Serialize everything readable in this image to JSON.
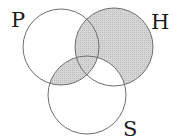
{
  "diagram": {
    "type": "venn",
    "sets": [
      {
        "id": "P",
        "label": "P",
        "cx": 61,
        "cy": 47,
        "r": 38,
        "label_x": 11,
        "label_y": 27
      },
      {
        "id": "H",
        "label": "H",
        "cx": 114,
        "cy": 47,
        "r": 39,
        "label_x": 151,
        "label_y": 29
      },
      {
        "id": "S",
        "label": "S",
        "cx": 87,
        "cy": 95,
        "r": 39,
        "label_x": 123,
        "label_y": 136
      }
    ],
    "shaded_regions": [
      "H only",
      "P∩H only",
      "P∩H∩S",
      "P∩S only"
    ],
    "unshaded_regions": [
      "P only",
      "S only",
      "H∩S only"
    ],
    "colors": {
      "shade": "#cfcfcf",
      "stroke": "#6e6e6e",
      "background": "#ffffff",
      "label": "#1a1a1a"
    }
  }
}
